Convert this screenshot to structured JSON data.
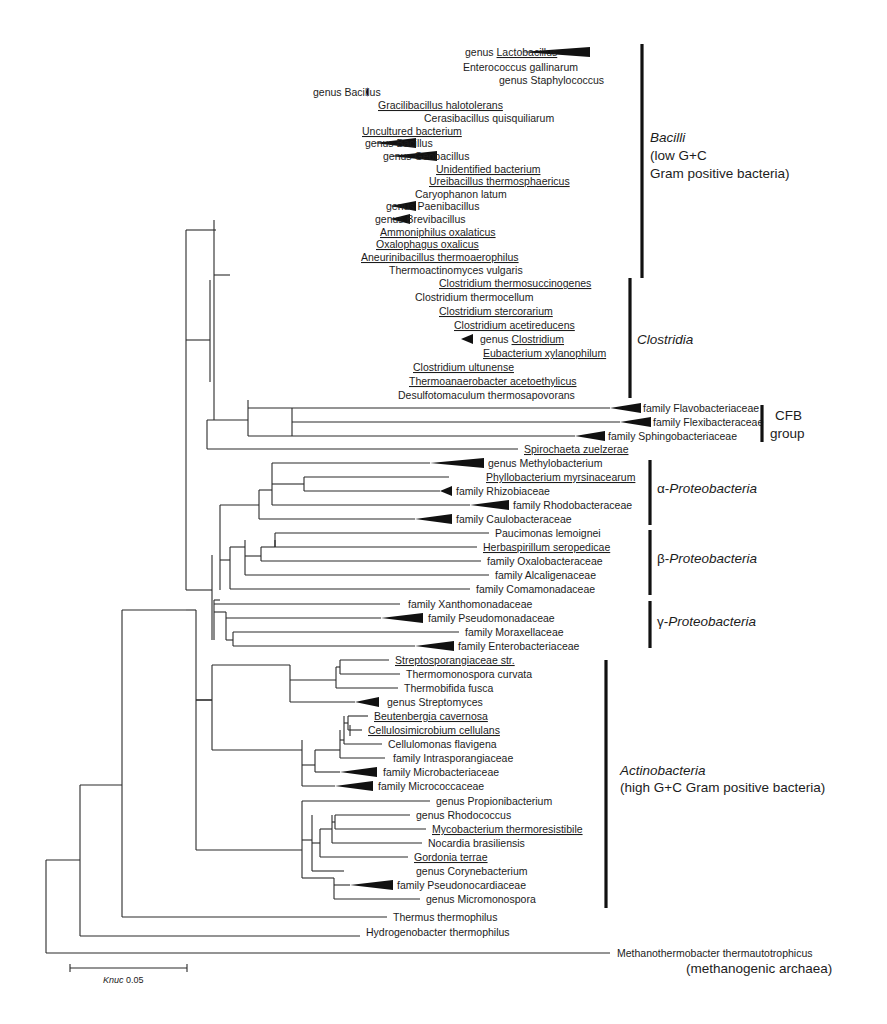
{
  "figure": {
    "type": "phylogenetic-tree",
    "scale_bar": {
      "label_prefix": "Knuc",
      "label_value": "0.05"
    },
    "outgroup_note": "(methanogenic archaea)"
  },
  "leaves": [
    {
      "label": "genus Lactobacillus",
      "prefix": "genus ",
      "underlined_part": "Lactobacillus",
      "collapsed": true
    },
    {
      "label": "Enterococcus gallinarum",
      "underlined": false
    },
    {
      "label": "genus Staphylococcus",
      "collapsed": true
    },
    {
      "label": "genus Bacillus",
      "collapsed": true
    },
    {
      "label": "Gracilibacillus halotolerans",
      "underlined": true
    },
    {
      "label": "Cerasibacillus quisquiliarum",
      "underlined": false
    },
    {
      "label": "Uncultured bacterium",
      "underlined": true
    },
    {
      "label": "genus Bacillus",
      "collapsed": true
    },
    {
      "label": "genus Geobacillus",
      "collapsed": true
    },
    {
      "label": "Unidentified bacterium",
      "underlined": true
    },
    {
      "label": "Ureibacillus thermosphaericus",
      "underlined": true
    },
    {
      "label": "Caryophanon latum",
      "underlined": false
    },
    {
      "label": "genus Paenibacillus",
      "collapsed": true
    },
    {
      "label": "genus Brevibacillus",
      "collapsed": true
    },
    {
      "label": "Ammoniphilus oxalaticus",
      "underlined": true
    },
    {
      "label": "Oxalophagus oxalicus",
      "underlined": true
    },
    {
      "label": "Aneurinibacillus thermoaerophilus",
      "underlined": true
    },
    {
      "label": "Thermoactinomyces vulgaris",
      "underlined": false
    },
    {
      "label": "Clostridium thermosuccinogenes",
      "underlined": true
    },
    {
      "label": "Clostridium thermocellum",
      "underlined": false
    },
    {
      "label": "Clostridium stercorarium",
      "underlined": true
    },
    {
      "label": "Clostridium acetireducens",
      "underlined": true
    },
    {
      "label": "genus Clostridium",
      "prefix": "genus ",
      "underlined_part": "Clostridium",
      "collapsed": true
    },
    {
      "label": "Eubacterium xylanophilum",
      "underlined": true
    },
    {
      "label": "Clostridium ultunense",
      "underlined": true
    },
    {
      "label": "Thermoanaerobacter acetoethylicus",
      "underlined": true
    },
    {
      "label": "Desulfotomaculum thermosapovorans",
      "underlined": false
    },
    {
      "label": "family Flavobacteriaceae",
      "collapsed": true
    },
    {
      "label": "family Flexibacteraceae",
      "collapsed": true
    },
    {
      "label": "family Sphingobacteriaceae",
      "collapsed": true
    },
    {
      "label": "Spirochaeta zuelzerae",
      "underlined": true
    },
    {
      "label": "genus Methylobacterium",
      "collapsed": true
    },
    {
      "label": "Phyllobacterium myrsinacearum",
      "underlined": true
    },
    {
      "label": "family Rhizobiaceae",
      "collapsed": true
    },
    {
      "label": "family Rhodobacteraceae",
      "collapsed": true
    },
    {
      "label": "family Caulobacteraceae",
      "collapsed": true
    },
    {
      "label": "Paucimonas lemoignei",
      "underlined": false
    },
    {
      "label": "Herbaspirillum seropedicae",
      "underlined": true
    },
    {
      "label": "family Oxalobacteraceae",
      "collapsed": true
    },
    {
      "label": "family Alcaligenaceae",
      "collapsed": true
    },
    {
      "label": "family Comamonadaceae",
      "collapsed": true
    },
    {
      "label": "family Xanthomonadaceae",
      "collapsed": true
    },
    {
      "label": "family Pseudomonadaceae",
      "collapsed": true
    },
    {
      "label": "family Moraxellaceae",
      "collapsed": true
    },
    {
      "label": "family Enterobacteriaceae",
      "collapsed": true
    },
    {
      "label": "Streptosporangiaceae str.",
      "underlined": true
    },
    {
      "label": "Thermomonospora curvata",
      "underlined": false
    },
    {
      "label": "Thermobifida fusca",
      "underlined": false
    },
    {
      "label": "genus Streptomyces",
      "collapsed": true
    },
    {
      "label": "Beutenbergia cavernosa",
      "underlined": true
    },
    {
      "label": "Cellulosimicrobium cellulans",
      "underlined": true
    },
    {
      "label": "Cellulomonas flavigena",
      "underlined": false
    },
    {
      "label": "family Intrasporangiaceae",
      "collapsed": true
    },
    {
      "label": "family Microbacteriaceae",
      "collapsed": true
    },
    {
      "label": "family Micrococcaceae",
      "collapsed": true
    },
    {
      "label": "genus Propionibacterium",
      "collapsed": true
    },
    {
      "label": "genus Rhodococcus",
      "collapsed": true
    },
    {
      "label": "Mycobacterium thermoresistibile",
      "underlined": true
    },
    {
      "label": "Nocardia brasiliensis",
      "underlined": false
    },
    {
      "label": "Gordonia terrae",
      "underlined": true
    },
    {
      "label": "genus Corynebacterium",
      "collapsed": true
    },
    {
      "label": "family Pseudonocardiaceae",
      "collapsed": true
    },
    {
      "label": "genus Micromonospora",
      "collapsed": true
    },
    {
      "label": "Thermus thermophilus",
      "underlined": false
    },
    {
      "label": "Hydrogenobacter thermophilus",
      "underlined": false
    },
    {
      "label": "Methanothermobacter thermautotrophicus",
      "underlined": false
    }
  ],
  "clades": [
    {
      "name": "Bacilli",
      "italic_part": "Bacilli",
      "lines": [
        "Bacilli",
        "(low G+C",
        " Gram positive bacteria)"
      ]
    },
    {
      "name": "Clostridia",
      "italic_part": "Clostridia",
      "lines": [
        "Clostridia"
      ]
    },
    {
      "name": "CFB group",
      "lines": [
        "CFB",
        "group"
      ]
    },
    {
      "name": "α-Proteobacteria",
      "greek": "α-",
      "italic_part": "Proteobacteria"
    },
    {
      "name": "β-Proteobacteria",
      "greek": "β-",
      "italic_part": "Proteobacteria"
    },
    {
      "name": "γ-Proteobacteria",
      "greek": "γ-",
      "italic_part": "Proteobacteria"
    },
    {
      "name": "Actinobacteria",
      "italic_part": "Actinobacteria",
      "lines": [
        "Actinobacteria",
        "(high G+C Gram positive bacteria)"
      ]
    }
  ],
  "layout": {
    "leaf_layout": [
      [
        52,
        462,
        521,
        "w",
        590
      ],
      [
        67,
        460,
        459,
        "",
        0
      ],
      [
        80,
        496,
        493,
        "",
        0
      ],
      [
        92,
        310,
        366,
        "w",
        368
      ],
      [
        105,
        375,
        370,
        "",
        0
      ],
      [
        118,
        421,
        418,
        "",
        0
      ],
      [
        131,
        359,
        355,
        "",
        0
      ],
      [
        143,
        362,
        374,
        "w",
        416
      ],
      [
        156,
        380,
        390,
        "w",
        437
      ],
      [
        169,
        433,
        430,
        "",
        0
      ],
      [
        181,
        426,
        423,
        "",
        0
      ],
      [
        194,
        412,
        409,
        "",
        0
      ],
      [
        206,
        383,
        390,
        "w",
        416
      ],
      [
        219,
        372,
        390,
        "w",
        410
      ],
      [
        232,
        377,
        374,
        "",
        0
      ],
      [
        244,
        373,
        370,
        "",
        0
      ],
      [
        257,
        358,
        355,
        "",
        0
      ],
      [
        270,
        386,
        383,
        "",
        0
      ],
      [
        283,
        436,
        433,
        "",
        0
      ],
      [
        297,
        412,
        409,
        "",
        0
      ],
      [
        311,
        436,
        433,
        "",
        0
      ],
      [
        325,
        451,
        448,
        "",
        0
      ],
      [
        339,
        477,
        461,
        "w",
        473
      ],
      [
        353,
        480,
        477,
        "",
        0
      ],
      [
        367,
        410,
        407,
        "",
        0
      ],
      [
        381,
        406,
        403,
        "",
        0
      ],
      [
        395,
        395,
        392,
        "",
        0
      ],
      [
        408,
        640,
        610,
        "w",
        641
      ],
      [
        422,
        650,
        620,
        "w",
        651
      ],
      [
        436,
        605,
        575,
        "w",
        605
      ],
      [
        449,
        521,
        518,
        "",
        0
      ],
      [
        463,
        485,
        430,
        "w",
        484
      ],
      [
        477,
        483,
        449,
        "",
        0
      ],
      [
        491,
        453,
        440,
        "w",
        452
      ],
      [
        505,
        510,
        470,
        "w",
        509
      ],
      [
        519,
        453,
        415,
        "w",
        452
      ],
      [
        533,
        492,
        489,
        "",
        0
      ],
      [
        547,
        480,
        477,
        "",
        0
      ],
      [
        561,
        484,
        481,
        "",
        0
      ],
      [
        575,
        492,
        489,
        "",
        0
      ],
      [
        589,
        473,
        470,
        "",
        0
      ],
      [
        604,
        405,
        400,
        "",
        0
      ],
      [
        618,
        425,
        381,
        "w",
        423
      ],
      [
        632,
        462,
        459,
        "",
        0
      ],
      [
        646,
        455,
        415,
        "w",
        454
      ],
      [
        660,
        392,
        389,
        "",
        0
      ],
      [
        674,
        403,
        400,
        "",
        0
      ],
      [
        688,
        401,
        398,
        "",
        0
      ],
      [
        702,
        384,
        355,
        "w",
        379
      ],
      [
        716,
        371,
        368,
        "",
        0
      ],
      [
        730,
        365,
        362,
        "",
        0
      ],
      [
        744,
        385,
        382,
        "",
        0
      ],
      [
        758,
        390,
        385,
        "",
        0
      ],
      [
        772,
        380,
        340,
        "w",
        377
      ],
      [
        786,
        375,
        335,
        "w",
        373
      ],
      [
        801,
        433,
        430,
        "",
        0
      ],
      [
        815,
        413,
        410,
        "",
        0
      ],
      [
        829,
        429,
        426,
        "",
        0
      ],
      [
        843,
        425,
        422,
        "",
        0
      ],
      [
        857,
        411,
        408,
        "",
        0
      ],
      [
        871,
        413,
        410,
        "",
        0
      ],
      [
        885,
        394,
        350,
        "w",
        393
      ],
      [
        899,
        423,
        420,
        "",
        0
      ],
      [
        917,
        390,
        387,
        "",
        0
      ],
      [
        932,
        363,
        360,
        "",
        0
      ],
      [
        953,
        614,
        610,
        "",
        0
      ]
    ],
    "segments": [
      [
        323,
        50,
        323,
        68
      ],
      [
        323,
        50,
        400,
        50
      ],
      [
        323,
        68,
        450,
        68
      ],
      [
        283,
        59,
        323,
        59
      ],
      [
        283,
        59,
        283,
        80
      ],
      [
        283,
        80,
        490,
        80
      ],
      [
        278,
        70,
        278,
        92
      ],
      [
        278,
        92,
        310,
        92
      ],
      [
        278,
        70,
        283,
        70
      ],
      [
        290,
        111,
        290,
        119
      ],
      [
        290,
        104,
        370,
        104
      ],
      [
        290,
        118,
        418,
        118
      ],
      [
        276,
        100,
        276,
        111
      ],
      [
        276,
        111,
        290,
        111
      ],
      [
        268,
        132,
        268,
        150
      ],
      [
        268,
        131,
        355,
        131
      ],
      [
        271,
        150,
        271,
        150
      ],
      [
        271,
        143,
        271,
        156
      ],
      [
        271,
        143,
        335,
        143
      ],
      [
        271,
        156,
        340,
        156
      ],
      [
        268,
        150,
        271,
        150
      ],
      [
        278,
        175,
        278,
        187
      ],
      [
        278,
        169,
        430,
        169
      ],
      [
        278,
        175,
        278,
        194
      ],
      [
        286,
        181,
        286,
        194
      ],
      [
        286,
        181,
        423,
        181
      ],
      [
        286,
        194,
        409,
        194
      ],
      [
        278,
        187,
        286,
        187
      ],
      [
        261,
        140,
        268,
        140
      ],
      [
        261,
        140,
        261,
        180
      ],
      [
        261,
        180,
        278,
        180
      ],
      [
        256,
        90,
        276,
        90
      ],
      [
        256,
        90,
        256,
        160
      ],
      [
        256,
        160,
        261,
        160
      ],
      [
        246,
        125,
        256,
        125
      ],
      [
        246,
        125,
        246,
        206
      ],
      [
        246,
        206,
        340,
        206
      ],
      [
        240,
        165,
        246,
        165
      ],
      [
        240,
        165,
        240,
        219
      ],
      [
        240,
        219,
        340,
        219
      ],
      [
        270,
        232,
        270,
        244
      ],
      [
        270,
        232,
        374,
        232
      ],
      [
        270,
        244,
        370,
        244
      ],
      [
        235,
        195,
        240,
        195
      ],
      [
        235,
        195,
        235,
        238
      ],
      [
        235,
        238,
        270,
        238
      ],
      [
        226,
        216,
        235,
        216
      ],
      [
        226,
        216,
        226,
        257
      ],
      [
        226,
        257,
        355,
        257
      ],
      [
        216,
        237,
        226,
        237
      ],
      [
        216,
        237,
        216,
        270
      ],
      [
        216,
        270,
        383,
        270
      ],
      [
        366,
        283,
        366,
        297
      ],
      [
        366,
        283,
        433,
        283
      ],
      [
        366,
        297,
        409,
        297
      ],
      [
        344,
        290,
        366,
        290
      ],
      [
        344,
        290,
        344,
        311
      ],
      [
        344,
        311,
        433,
        311
      ],
      [
        415,
        339,
        415,
        353
      ],
      [
        415,
        339,
        461,
        339
      ],
      [
        415,
        353,
        477,
        353
      ],
      [
        302,
        325,
        448,
        325
      ],
      [
        302,
        325,
        302,
        346
      ],
      [
        302,
        346,
        415,
        346
      ],
      [
        283,
        300,
        344,
        300
      ],
      [
        283,
        300,
        283,
        336
      ],
      [
        283,
        336,
        302,
        336
      ],
      [
        270,
        318,
        283,
        318
      ],
      [
        270,
        318,
        270,
        367
      ],
      [
        270,
        367,
        407,
        367
      ],
      [
        266,
        388,
        266,
        395
      ],
      [
        266,
        381,
        403,
        381
      ],
      [
        266,
        395,
        392,
        395
      ],
      [
        266,
        381,
        266,
        395
      ],
      [
        258,
        343,
        270,
        343
      ],
      [
        258,
        343,
        258,
        388
      ],
      [
        258,
        388,
        266,
        388
      ],
      [
        248,
        275,
        216,
        275
      ],
      [
        248,
        250,
        248,
        360
      ],
      [
        216,
        250,
        248,
        250
      ],
      [
        216,
        250,
        216,
        275
      ],
      [
        230,
        305,
        258,
        305
      ],
      [
        230,
        255,
        230,
        360
      ],
      [
        230,
        360,
        258,
        360
      ]
    ]
  },
  "clade_bars": [
    {
      "x": 642,
      "y1": 44,
      "y2": 278
    },
    {
      "x": 630,
      "y1": 278,
      "y2": 398
    },
    {
      "x": 762,
      "y1": 405,
      "y2": 442
    },
    {
      "x": 650,
      "y1": 460,
      "y2": 525
    },
    {
      "x": 650,
      "y1": 530,
      "y2": 595
    },
    {
      "x": 650,
      "y1": 601,
      "y2": 648
    },
    {
      "x": 606,
      "y1": 660,
      "y2": 908
    }
  ],
  "background_ghost_text": {
    "description": "faint bleed-through text from the reverse page",
    "lines": [
      "",
      "",
      "",
      "",
      ""
    ]
  }
}
